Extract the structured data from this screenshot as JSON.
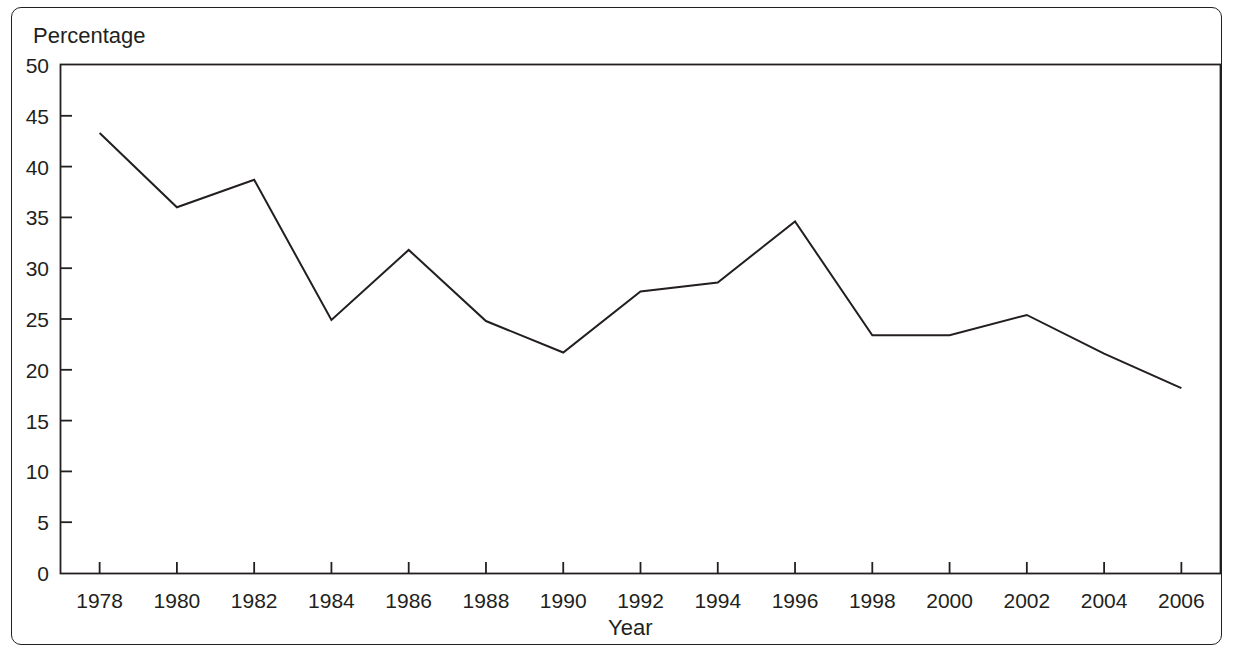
{
  "chart_data": {
    "type": "line",
    "title": "",
    "xlabel": "Year",
    "ylabel": "Percentage",
    "xlim": [
      1977,
      2007
    ],
    "ylim": [
      0,
      50
    ],
    "ytick_step": 5,
    "xtick_step": 2,
    "grid": false,
    "legend": null,
    "line_color": "#231f20",
    "categories": [
      1978,
      1980,
      1982,
      1984,
      1986,
      1988,
      1990,
      1992,
      1994,
      1996,
      1998,
      2000,
      2002,
      2004,
      2006
    ],
    "values": [
      43.3,
      36.0,
      38.7,
      24.9,
      31.8,
      24.8,
      21.7,
      27.7,
      28.6,
      34.6,
      23.4,
      23.4,
      25.4,
      21.6,
      18.2
    ],
    "series": [
      {
        "name": "Percentage",
        "values": [
          43.3,
          36.0,
          38.7,
          24.9,
          31.8,
          24.8,
          21.7,
          27.7,
          28.6,
          34.6,
          23.4,
          23.4,
          25.4,
          21.6,
          18.2
        ]
      }
    ],
    "ytick_labels": [
      "50",
      "45",
      "40",
      "35",
      "30",
      "25",
      "20",
      "15",
      "10",
      "5",
      "0"
    ],
    "ytick_values": [
      50,
      45,
      40,
      35,
      30,
      25,
      20,
      15,
      10,
      5,
      0
    ],
    "xtick_labels": [
      "1978",
      "1980",
      "1982",
      "1984",
      "1986",
      "1988",
      "1990",
      "1992",
      "1994",
      "1996",
      "1998",
      "2000",
      "2002",
      "2004",
      "2006"
    ],
    "xtick_values": [
      1978,
      1980,
      1982,
      1984,
      1986,
      1988,
      1990,
      1992,
      1994,
      1996,
      1998,
      2000,
      2002,
      2004,
      2006
    ]
  }
}
